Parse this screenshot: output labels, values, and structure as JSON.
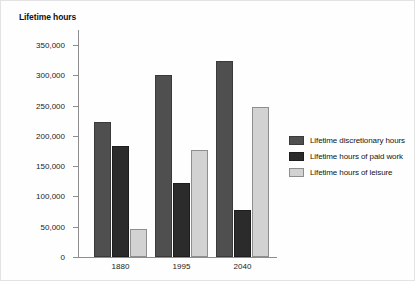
{
  "chart_data": {
    "type": "bar",
    "title": "Lifetime hours",
    "xlabel": "",
    "ylabel": "Lifetime hours",
    "categories": [
      "1880",
      "1995",
      "2040"
    ],
    "ylim": [
      0,
      375000
    ],
    "yticks": [
      0,
      50000,
      100000,
      150000,
      200000,
      250000,
      300000,
      350000
    ],
    "ytick_labels": [
      "0",
      "50,000",
      "100,000",
      "150,000",
      "200,000",
      "250,000",
      "300,000",
      "350,000"
    ],
    "grid": false,
    "legend_position": "right",
    "series": [
      {
        "name": "Lifetime discretionary hours",
        "color": "#4f4f4f",
        "values": [
          223000,
          301000,
          323000
        ]
      },
      {
        "name": "Lifetime hours of paid work",
        "color": "#2b2b2b",
        "values": [
          183000,
          122000,
          78000
        ]
      },
      {
        "name": "Lifetime hours of leisure",
        "color": "#d2d2d2",
        "values": [
          46000,
          177000,
          248000
        ]
      }
    ]
  },
  "legend": {
    "items": [
      {
        "label": "Lifetime discretionary hours"
      },
      {
        "label": "Lifetime hours of paid work"
      },
      {
        "label": "Lifetime hours of leisure"
      }
    ]
  }
}
